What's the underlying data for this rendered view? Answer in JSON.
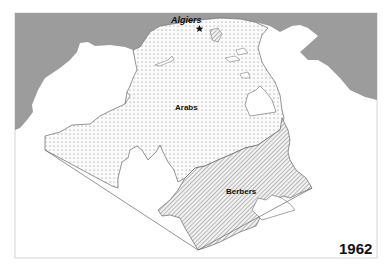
{
  "map": {
    "year": "1962",
    "city": {
      "name": "Algiers",
      "marker": "star"
    },
    "regions": [
      {
        "name": "Arabs",
        "pattern": "dots"
      },
      {
        "name": "Berbers",
        "pattern": "diagonal-hatch"
      }
    ],
    "colors": {
      "sea": "#9a9a9a",
      "land": "#ffffff",
      "border": "#666666",
      "dots": "#777777",
      "hatch": "#777777",
      "text": "#111111"
    }
  }
}
